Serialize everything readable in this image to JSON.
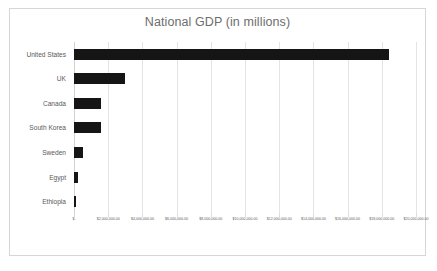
{
  "chart_data": {
    "type": "bar",
    "orientation": "horizontal",
    "title": "National GDP (in millions)",
    "xlabel": "",
    "ylabel": "",
    "categories": [
      "United States",
      "UK",
      "Canada",
      "South Korea",
      "Sweden",
      "Egypt",
      "Ethiopia"
    ],
    "values": [
      18450000,
      3000000,
      1600000,
      1600000,
      550000,
      240000,
      100000
    ],
    "xlim": [
      0,
      20000000
    ],
    "xtick_values": [
      0,
      2000000,
      4000000,
      6000000,
      8000000,
      10000000,
      12000000,
      14000000,
      16000000,
      18000000,
      20000000
    ],
    "xtick_labels": [
      "$-",
      "$2,000,000.00",
      "$4,000,000.00",
      "$6,000,000.00",
      "$8,000,000.00",
      "$10,000,000.00",
      "$12,000,000.00",
      "$14,000,000.00",
      "$16,000,000.00",
      "$18,000,000.00",
      "$20,000,000.00"
    ],
    "grid": true,
    "grid_axis": "x",
    "legend": false,
    "legend_position": "none",
    "bar_color": "#151515",
    "grid_color": "#e4e4e4",
    "title_color": "#6d6d6d",
    "label_color": "#595959",
    "plot_background": "#ffffff",
    "frame_color": "#d6d6d6"
  }
}
